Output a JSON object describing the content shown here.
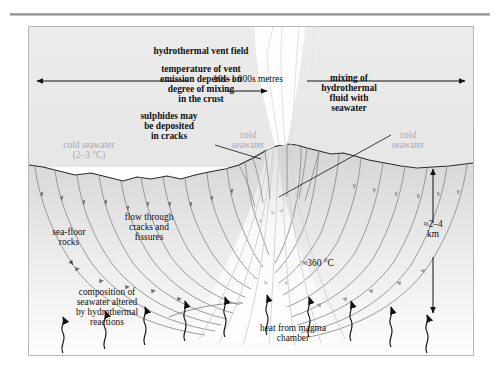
{
  "figure": {
    "title_rule": "",
    "background_color": "#ffffff",
    "frame_color": "#b9b9b9",
    "seawater_color": "#ebebeb",
    "crust_color": "#d9d9d9",
    "flowline_color": "#7a7a7a",
    "plume_color": "#f7f7f7",
    "gray_label_color": "#a9a9a9"
  },
  "labels": {
    "vent_field": "hydrothermal vent field",
    "temperature_note": "temperature of vent\nemission depends on\ndegree of mixing\nin the crust",
    "mixing_note": "mixing of\nhydrothermal\nfluid with\nseawater",
    "sulphides_note": "sulphides may\nbe deposited\nin cracks",
    "cold_seawater_left_top": "cold seawater\n(2–3 °C)",
    "cold_seawater_mid": "cold\nseawater",
    "cold_seawater_right": "cold\nseawater",
    "scale_horizontal": "10s–1 000s metres",
    "sea_floor_rocks": "sea-floor\nrocks",
    "flow_through": "flow through\ncracks and\nfissures",
    "composition_note": "composition of\nseawater altered\nby hydrothermal\nreactions",
    "temp_deep": "≈360 °C",
    "depth_scale": "≈2–4\nkm",
    "heat_source": "heat from magma\nchamber"
  },
  "annotations": {
    "horizontal_scale_arrow": "double-headed-arrow",
    "depth_scale_arrow": "double-headed-vertical-arrow",
    "heat_arrows": "wavy-arrows-upward",
    "flow_direction": "arrowheads-along-streamlines"
  }
}
